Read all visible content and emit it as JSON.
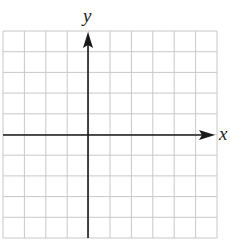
{
  "diagram": {
    "type": "coordinate-grid",
    "x_axis_label": "x",
    "y_axis_label": "y",
    "grid": {
      "columns": 10,
      "rows": 10,
      "columns_left_of_y_axis": 4,
      "columns_right_of_y_axis": 6,
      "rows_above_x_axis": 5,
      "rows_below_x_axis": 5
    },
    "colors": {
      "grid_line": "#c8c8c8",
      "axis": "#1a1a1a",
      "background": "#ffffff"
    }
  }
}
